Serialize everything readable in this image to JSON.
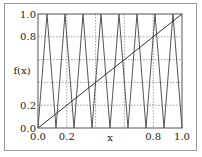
{
  "chart_data": {
    "type": "line",
    "title": "",
    "xlabel": "x",
    "ylabel": "f(x)",
    "xlim": [
      0.0,
      1.0
    ],
    "ylim": [
      0.0,
      1.0
    ],
    "grid": true,
    "grid_style": "dotted",
    "grid_x": [
      0.2,
      0.4,
      0.6,
      0.8
    ],
    "grid_y": [
      0.2,
      0.4,
      0.6,
      0.8
    ],
    "xticks": [
      0.0,
      0.2,
      0.8,
      1.0
    ],
    "xtick_labels": [
      "0.0",
      "0.2",
      "0.8",
      "1.0"
    ],
    "yticks": [
      0.0,
      0.2,
      0.8,
      1.0
    ],
    "ytick_labels": [
      "0.0",
      "0.2",
      "0.8",
      "1.0"
    ],
    "series": [
      {
        "name": "f(x) (4th iterate of tent map)",
        "color": "#555555",
        "x": [
          0,
          0.0625,
          0.125,
          0.1875,
          0.25,
          0.3125,
          0.375,
          0.4375,
          0.5,
          0.5625,
          0.625,
          0.6875,
          0.75,
          0.8125,
          0.875,
          0.9375,
          1.0
        ],
        "y": [
          0,
          1,
          0,
          1,
          0,
          1,
          0,
          1,
          0,
          1,
          0,
          1,
          0,
          1,
          0,
          1,
          0
        ]
      },
      {
        "name": "y = x",
        "color": "#333333",
        "x": [
          0,
          1
        ],
        "y": [
          0,
          1
        ]
      }
    ]
  }
}
